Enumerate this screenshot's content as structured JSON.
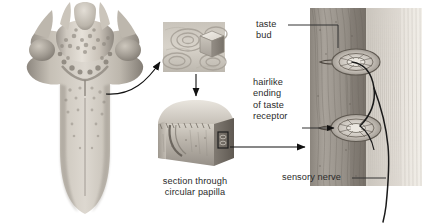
{
  "figure": {
    "background": "#ffffff",
    "ink": "#2b2b2b",
    "width": 422,
    "height": 224
  },
  "labels": {
    "taste_bud": "taste\nbud",
    "hairlike_ending": "hairlike\nending\nof taste\nreceptor",
    "sensory_nerve": "sensory nerve",
    "section_caption": "section through\ncircular papilla"
  },
  "panels": {
    "tongue": {
      "name": "dorsal surface of tongue"
    },
    "papilla_inset": {
      "name": "circular papillae magnified"
    },
    "section_block": {
      "name": "3D section through circular papilla"
    },
    "histology": {
      "name": "taste buds in epithelium with sensory nerve"
    }
  },
  "connectors": {
    "tongue_to_inset": "curved arrow",
    "inset_to_block": "vertical arrow",
    "block_to_histology": "horizontal arrow",
    "taste_bud_leader": "elbow leader line",
    "receptor_leader": "straight arrow leader",
    "nerve_leader": "straight leader line"
  }
}
